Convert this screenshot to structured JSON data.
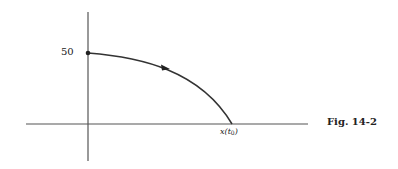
{
  "figure": {
    "caption": "Fig. 14-2",
    "y_intercept_label": "50",
    "x_intercept_label_main": "x(t",
    "x_intercept_label_sub": "0",
    "x_intercept_label_close": ")",
    "colors": {
      "line": "#333333",
      "axis": "#555555",
      "background": "#ffffff"
    }
  },
  "diagram": {
    "type": "curve-sketch",
    "axes": {
      "origin_px": [
        88,
        124
      ],
      "x_axis_px": [
        26,
        308
      ],
      "y_axis_px": [
        12,
        161
      ]
    },
    "curve": {
      "start": {
        "label": "50",
        "px": [
          88,
          53
        ]
      },
      "end": {
        "label": "x(t0)",
        "px": [
          232,
          124
        ]
      },
      "direction_arrow_px": [
        165,
        67
      ],
      "shape": "concave-down decreasing from y=50 to x-axis"
    }
  }
}
